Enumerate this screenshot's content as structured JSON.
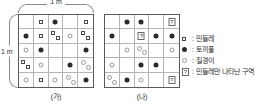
{
  "dimensions": {
    "top_label": "1 m",
    "left_label": "1 m"
  },
  "plots": [
    {
      "id": "plot-a",
      "caption": "(가)",
      "rows": [
        [
          [],
          [
            "sq-c"
          ],
          [
            "dot-c"
          ],
          [],
          [
            "sq-c"
          ]
        ],
        [
          [
            "dot-c"
          ],
          [
            "sq-c"
          ],
          [
            "sq-tl",
            "sq-br"
          ],
          [
            "ring-c"
          ],
          [
            "sq-tl",
            "sq-br"
          ]
        ],
        [
          [
            "ring-c"
          ],
          [
            "dot-c"
          ],
          [],
          [],
          [
            "dot-c"
          ]
        ],
        [
          [
            "sq-tl",
            "sq-br"
          ],
          [
            "ring-c"
          ],
          [],
          [
            "dot-c"
          ],
          [
            "ring-tl",
            "ring-br"
          ]
        ],
        [
          [
            "ring-c"
          ],
          [
            "sq-c"
          ],
          [
            "ring-c"
          ],
          [
            "ring-tl",
            "ring-br"
          ],
          [
            "dot-c"
          ]
        ]
      ]
    },
    {
      "id": "plot-b",
      "caption": "(나)",
      "rows": [
        [
          [],
          [
            "dot-c"
          ],
          [
            "dot-c"
          ],
          [],
          [
            "q-c"
          ]
        ],
        [
          [
            "dot-c"
          ],
          [],
          [
            "q-c"
          ],
          [
            "dot-c"
          ],
          [
            "dot-c"
          ]
        ],
        [
          [],
          [
            "ring-c"
          ],
          [
            "ring-tl",
            "ring-br"
          ],
          [],
          [
            "ring-c"
          ]
        ],
        [
          [
            "ring-c"
          ],
          [],
          [
            "dot-c"
          ],
          [
            "dot-c"
          ],
          []
        ],
        [
          [
            "ring-tl",
            "ring-br"
          ],
          [
            "dot-c"
          ],
          [
            "ring-c"
          ],
          [],
          [
            "q-c"
          ]
        ]
      ]
    }
  ],
  "legend": {
    "items": [
      {
        "symbol": "open-square",
        "colon": ":",
        "label": "민들레"
      },
      {
        "symbol": "filled-circle",
        "colon": ":",
        "label": "토끼풀"
      },
      {
        "symbol": "open-circle",
        "colon": ":",
        "label": "질경이"
      },
      {
        "symbol": "question-box",
        "colon": ":",
        "label": "민들레만 나타난 구역"
      }
    ],
    "question_mark": "?"
  },
  "colors": {
    "grid_border": "#5a5a5a",
    "grid_line": "#b4b4b4",
    "filled": "#2a2a2a",
    "open_stroke": "#9a9a9a",
    "square_stroke": "#4a4a4a",
    "brace": "#8a8a8a"
  }
}
